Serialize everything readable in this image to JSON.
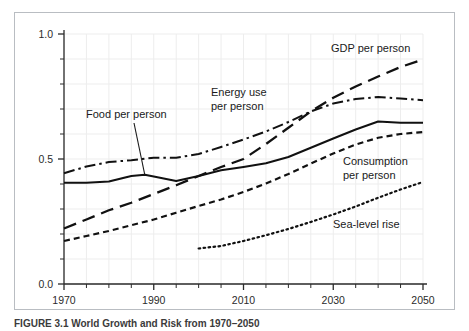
{
  "figure": {
    "caption": "FIGURE 3.1   World Growth and Risk from 1970–2050"
  },
  "chart_data": {
    "type": "line",
    "title": "",
    "subtitle": "",
    "xlabel": "",
    "ylabel": "",
    "xlim": [
      1970,
      2050
    ],
    "ylim": [
      0.0,
      1.0
    ],
    "grid": true,
    "legend_position": "inline-annotations",
    "x_ticks": [
      1970,
      1990,
      2010,
      2030,
      2050
    ],
    "x_tick_labels": [
      "1970",
      "1990",
      "2010",
      "2030",
      "2050"
    ],
    "x_minor_tick_step": 5,
    "y_ticks": [
      0.0,
      0.5,
      1.0
    ],
    "y_tick_labels": [
      "0.0",
      "0.5",
      "1.0"
    ],
    "y_minor_tick_step": 0.1,
    "series": [
      {
        "name": "Food per person",
        "style": "solid",
        "x": [
          1970,
          1975,
          1980,
          1985,
          1988,
          1990,
          1995,
          2000,
          2005,
          2010,
          2015,
          2020,
          2025,
          2030,
          2035,
          2040,
          2045,
          2050
        ],
        "values": [
          0.405,
          0.405,
          0.41,
          0.432,
          0.437,
          0.43,
          0.412,
          0.432,
          0.455,
          0.468,
          0.483,
          0.508,
          0.545,
          0.582,
          0.618,
          0.65,
          0.645,
          0.645
        ]
      },
      {
        "name": "Energy use per person",
        "style": "dash-dot",
        "x": [
          1970,
          1975,
          1980,
          1985,
          1990,
          1995,
          2000,
          2005,
          2010,
          2015,
          2020,
          2025,
          2030,
          2035,
          2040,
          2045,
          2050
        ],
        "values": [
          0.443,
          0.47,
          0.488,
          0.495,
          0.505,
          0.505,
          0.52,
          0.548,
          0.578,
          0.61,
          0.648,
          0.69,
          0.722,
          0.74,
          0.748,
          0.742,
          0.735
        ]
      },
      {
        "name": "GDP per person",
        "style": "long-dash",
        "x": [
          1970,
          1975,
          1980,
          1985,
          1990,
          1995,
          2000,
          2005,
          2010,
          2015,
          2020,
          2025,
          2030,
          2035,
          2040,
          2045,
          2050
        ],
        "values": [
          0.222,
          0.258,
          0.295,
          0.325,
          0.36,
          0.395,
          0.432,
          0.468,
          0.5,
          0.56,
          0.625,
          0.69,
          0.745,
          0.79,
          0.83,
          0.868,
          0.898
        ]
      },
      {
        "name": "Consumption per person",
        "style": "short-dash",
        "x": [
          1970,
          1975,
          1980,
          1985,
          1990,
          1995,
          2000,
          2005,
          2010,
          2015,
          2020,
          2025,
          2030,
          2035,
          2040,
          2045,
          2050
        ],
        "values": [
          0.172,
          0.192,
          0.212,
          0.235,
          0.258,
          0.285,
          0.312,
          0.338,
          0.368,
          0.402,
          0.44,
          0.482,
          0.522,
          0.558,
          0.585,
          0.6,
          0.608
        ]
      },
      {
        "name": "Sea-level rise",
        "style": "dotted",
        "x": [
          2000,
          2005,
          2010,
          2015,
          2020,
          2025,
          2030,
          2035,
          2040,
          2045,
          2050
        ],
        "values": [
          0.142,
          0.152,
          0.172,
          0.195,
          0.22,
          0.248,
          0.278,
          0.31,
          0.345,
          0.378,
          0.408
        ]
      }
    ],
    "annotations": [
      {
        "name": "food-per-person-label",
        "text": "Food per person",
        "lines": [
          "Food per person"
        ],
        "x_px": 86,
        "y_px": 118,
        "leader": true
      },
      {
        "name": "energy-use-label",
        "text": "Energy use per person",
        "lines": [
          "Energy use",
          "per person"
        ],
        "x_px": 211,
        "y_px": 96,
        "leader": false
      },
      {
        "name": "gdp-per-person-label",
        "text": "GDP per person",
        "lines": [
          "GDP per person"
        ],
        "x_px": 331,
        "y_px": 52,
        "leader": false
      },
      {
        "name": "consumption-label",
        "text": "Consumption per person",
        "lines": [
          "Consumption",
          "per person"
        ],
        "x_px": 343,
        "y_px": 165,
        "leader": false
      },
      {
        "name": "sea-level-rise-label",
        "text": "Sea-level rise",
        "lines": [
          "Sea-level rise"
        ],
        "x_px": 333,
        "y_px": 228,
        "leader": false
      }
    ]
  }
}
